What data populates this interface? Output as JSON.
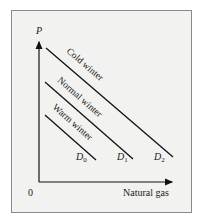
{
  "figure": {
    "y_axis_label": "P",
    "x_axis_label": "Natural gas",
    "origin_label": "0",
    "curves": [
      {
        "id": "D0",
        "base": "D",
        "sub": "0",
        "label": "Warm winter",
        "x1": 45,
        "y1": 115,
        "x2": 96,
        "y2": 160
      },
      {
        "id": "D1",
        "base": "D",
        "sub": "1",
        "label": "Normal winter",
        "x1": 45,
        "y1": 82,
        "x2": 133,
        "y2": 159
      },
      {
        "id": "D2",
        "base": "D",
        "sub": "2",
        "label": "Cold winter",
        "x1": 46,
        "y1": 48,
        "x2": 173,
        "y2": 157
      }
    ],
    "colors": {
      "line": "#111111",
      "background": "#f2f2f0",
      "border": "#8a8a8a"
    }
  }
}
